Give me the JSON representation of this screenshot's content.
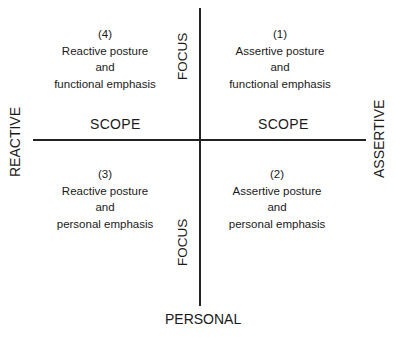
{
  "axes": {
    "top_label": "",
    "bottom_label": "PERSONAL",
    "left_label": "REACTIVE",
    "right_label": "ASSERTIVE",
    "vertical_axis_labels": [
      "FOCUS",
      "FOCUS"
    ],
    "horizontal_axis_labels": [
      "SCOPE",
      "SCOPE"
    ]
  },
  "quadrants": [
    {
      "number": "(1)",
      "line1": "Assertive posture",
      "line2": "and",
      "line3": "functional emphasis",
      "position": "top-right"
    },
    {
      "number": "(2)",
      "line1": "Assertive posture",
      "line2": "and",
      "line3": "personal emphasis",
      "position": "bottom-right"
    },
    {
      "number": "(3)",
      "line1": "Reactive posture",
      "line2": "and",
      "line3": "personal emphasis",
      "position": "bottom-left"
    },
    {
      "number": "(4)",
      "line1": "Reactive posture",
      "line2": "and",
      "line3": "functional emphasis",
      "position": "top-left"
    }
  ]
}
